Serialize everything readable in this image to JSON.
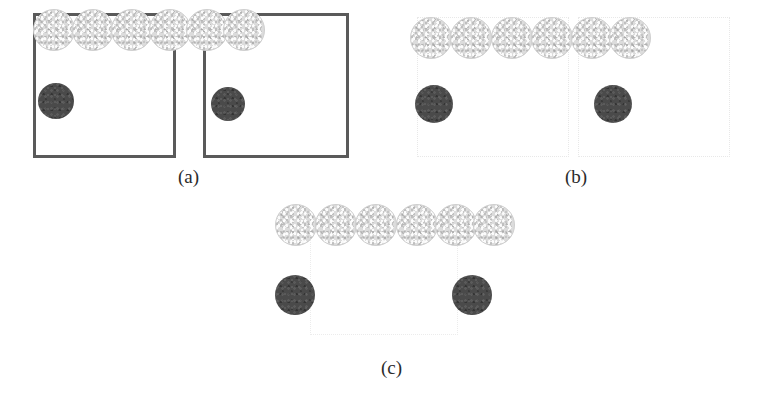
{
  "figure": {
    "width": 767,
    "height": 406,
    "background_color": "#ffffff",
    "colors": {
      "box_solid_border": "#5a5a5a",
      "box_faint_border": "#e8e8e8",
      "light_circle_fill": "#dcdcdc",
      "light_circle_border": "#cfcfcf",
      "dark_circle_fill": "#4a4a4a",
      "label_text": "#2b2b2b",
      "page_background": "#ffffff"
    }
  },
  "panels": [
    {
      "id": "a",
      "label": "(a)",
      "label_x": 178,
      "label_y": 167,
      "box_style": "solid",
      "boxes": [
        {
          "name": "left-box",
          "x": 33,
          "y": 13,
          "w": 143,
          "h": 145
        },
        {
          "name": "right-box",
          "x": 203,
          "y": 13,
          "w": 146,
          "h": 145
        }
      ],
      "light_circles": [
        {
          "cx": 54,
          "cy": 30,
          "r": 21
        },
        {
          "cx": 93,
          "cy": 30,
          "r": 21
        },
        {
          "cx": 132,
          "cy": 30,
          "r": 21
        },
        {
          "cx": 170,
          "cy": 30,
          "r": 21
        },
        {
          "cx": 207,
          "cy": 30,
          "r": 21
        },
        {
          "cx": 244,
          "cy": 30,
          "r": 21
        }
      ],
      "dark_circles": [
        {
          "cx": 56,
          "cy": 101,
          "r": 18
        },
        {
          "cx": 228,
          "cy": 104,
          "r": 17
        }
      ]
    },
    {
      "id": "b",
      "label": "(b)",
      "label_x": 565,
      "label_y": 167,
      "box_style": "faint",
      "boxes": [
        {
          "name": "left-box",
          "x": 417,
          "y": 17,
          "w": 152,
          "h": 140
        },
        {
          "name": "right-box",
          "x": 578,
          "y": 17,
          "w": 152,
          "h": 140
        }
      ],
      "light_circles": [
        {
          "cx": 431,
          "cy": 38,
          "r": 21
        },
        {
          "cx": 471,
          "cy": 38,
          "r": 21
        },
        {
          "cx": 512,
          "cy": 38,
          "r": 21
        },
        {
          "cx": 552,
          "cy": 38,
          "r": 21
        },
        {
          "cx": 592,
          "cy": 38,
          "r": 21
        },
        {
          "cx": 630,
          "cy": 38,
          "r": 21
        }
      ],
      "dark_circles": [
        {
          "cx": 434,
          "cy": 104,
          "r": 19
        },
        {
          "cx": 613,
          "cy": 104,
          "r": 19
        }
      ]
    },
    {
      "id": "c",
      "label": "(c)",
      "label_x": 381,
      "label_y": 358,
      "box_style": "faint-open",
      "boxes": [
        {
          "name": "center-box",
          "x": 310,
          "y": 222,
          "w": 148,
          "h": 113
        }
      ],
      "light_circles": [
        {
          "cx": 296,
          "cy": 225,
          "r": 21
        },
        {
          "cx": 336,
          "cy": 225,
          "r": 21
        },
        {
          "cx": 376,
          "cy": 225,
          "r": 21
        },
        {
          "cx": 417,
          "cy": 225,
          "r": 21
        },
        {
          "cx": 456,
          "cy": 225,
          "r": 21
        },
        {
          "cx": 494,
          "cy": 225,
          "r": 21
        }
      ],
      "dark_circles": [
        {
          "cx": 295,
          "cy": 295,
          "r": 20
        },
        {
          "cx": 472,
          "cy": 295,
          "r": 20
        }
      ]
    }
  ]
}
